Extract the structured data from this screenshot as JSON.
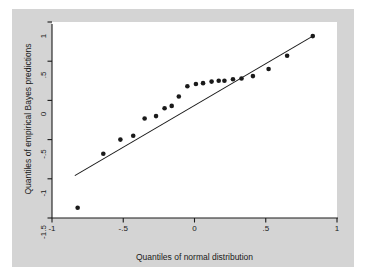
{
  "figure": {
    "background_color": "#ffffff",
    "graph_region_color": "#d4d4d4",
    "plot_area_color": "#ffffff",
    "axis_color": "#1a1a1a",
    "marker_color": "#1a1a1a",
    "line_color": "#1a1a1a"
  },
  "chart_data": {
    "type": "scatter",
    "title": "",
    "subtitle": "",
    "xlabel": "Quantiles of normal distribution",
    "ylabel": "Quantiles of empirical Bayes predictions",
    "xlim": [
      -1,
      1
    ],
    "ylim": [
      -1.5,
      1
    ],
    "xticks": [
      -1,
      -0.5,
      0,
      0.5,
      1
    ],
    "xtick_labels": [
      "-1",
      "-.5",
      "0",
      ".5",
      "1"
    ],
    "yticks": [
      -1.5,
      -1,
      -0.5,
      0,
      0.5,
      1
    ],
    "ytick_labels": [
      "-1.5",
      "-1",
      "-.5",
      "0",
      ".5",
      "1"
    ],
    "grid": false,
    "legend": null,
    "legend_position": "none",
    "marker_shape": "circle",
    "marker_size_px": 4.6,
    "series": [
      {
        "name": "Quantiles of empirical Bayes predictions",
        "x": [
          -0.82,
          -0.64,
          -0.52,
          -0.43,
          -0.35,
          -0.27,
          -0.21,
          -0.16,
          -0.11,
          -0.05,
          0.01,
          0.06,
          0.12,
          0.17,
          0.21,
          0.27,
          0.33,
          0.41,
          0.52,
          0.65,
          0.83
        ],
        "y": [
          -1.37,
          -0.68,
          -0.5,
          -0.45,
          -0.23,
          -0.2,
          -0.1,
          -0.07,
          0.05,
          0.18,
          0.21,
          0.22,
          0.24,
          0.25,
          0.25,
          0.27,
          0.28,
          0.31,
          0.4,
          0.57,
          0.82
        ]
      }
    ],
    "reference_line": {
      "name": "45-degree reference line",
      "x_start": -0.84,
      "y_start": -0.96,
      "x_end": 0.83,
      "y_end": 0.82
    }
  },
  "axes": {
    "x_tick_labels": [
      "-1",
      "-.5",
      "0",
      ".5",
      "1"
    ],
    "y_tick_labels": [
      "1",
      ".5",
      "0",
      "-.5",
      "-1",
      "-1.5"
    ],
    "x_title": "Quantiles of normal distribution",
    "y_title": "Quantiles of empirical Bayes predictions"
  }
}
